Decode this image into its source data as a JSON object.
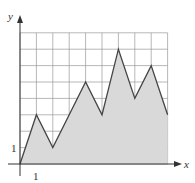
{
  "chart_data": {
    "type": "area",
    "title": "",
    "xlabel": "x",
    "ylabel": "y",
    "x": [
      0,
      1,
      2,
      3,
      4,
      5,
      6,
      7,
      8,
      9
    ],
    "values": [
      0,
      3,
      1,
      3,
      5,
      3,
      7,
      4,
      6,
      3
    ],
    "xlim": [
      0,
      9
    ],
    "ylim": [
      0,
      8
    ],
    "grid": true,
    "tick_labels": {
      "x": [
        "1"
      ],
      "y": [
        "1"
      ]
    },
    "fill_color": "#d9d9d9",
    "line_color": "#444444"
  }
}
